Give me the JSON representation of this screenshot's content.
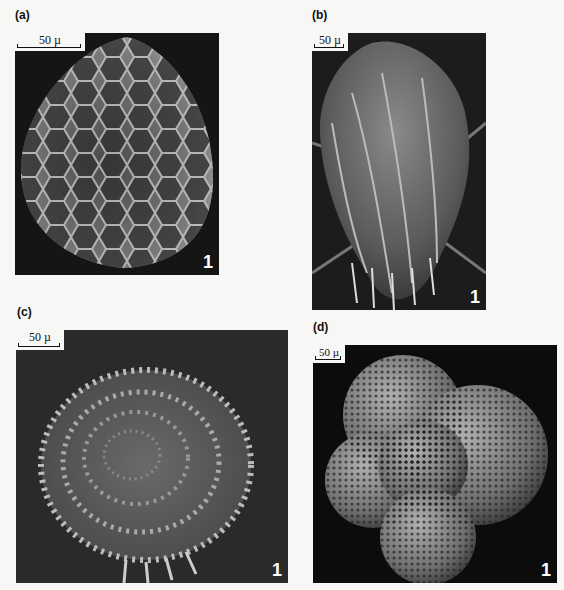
{
  "figure": {
    "panels": [
      {
        "label": "(a)",
        "scale": "50 µ",
        "number": "1",
        "subject": "honeycomb-ornamented ovoid microfossil (SEM)"
      },
      {
        "label": "(b)",
        "scale": "50 µ",
        "number": "1",
        "subject": "ribbed, spine-fringed microfossil (SEM)"
      },
      {
        "label": "(c)",
        "scale": "50 µ",
        "number": "1",
        "subject": "coiled spiral spiny microfossil (SEM)"
      },
      {
        "label": "(d)",
        "scale": "50 µ",
        "number": "1",
        "subject": "multi-chambered pitted foraminifer (SEM)"
      }
    ],
    "colors": {
      "background": "#f7f7f5",
      "photo_bg": "#151515",
      "text": "#111111"
    }
  }
}
